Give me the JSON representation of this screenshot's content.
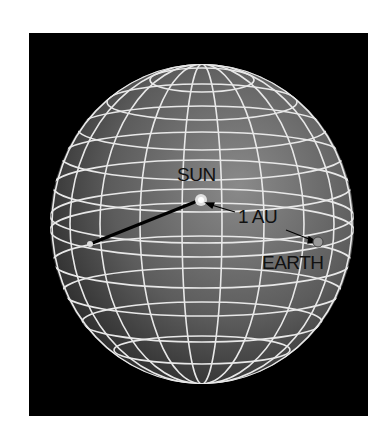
{
  "diagram": {
    "labels": {
      "sun": "SUN",
      "distance": "1 AU",
      "earth": "EARTH"
    },
    "colors": {
      "background": "#000000",
      "sphere": "#6f6f6f",
      "grid": "#e8e8e8",
      "text": "#111111"
    }
  }
}
